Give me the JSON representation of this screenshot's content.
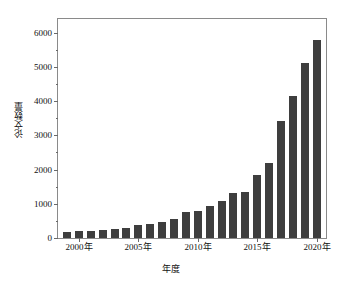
{
  "chart_data": {
    "type": "bar",
    "title": "",
    "xlabel": "年度",
    "ylabel": "论文数量",
    "categories": [
      "1999",
      "2000",
      "2001",
      "2002",
      "2003",
      "2004",
      "2005",
      "2006",
      "2007",
      "2008",
      "2009",
      "2010",
      "2011",
      "2012",
      "2013",
      "2014",
      "2015",
      "2016",
      "2017",
      "2018",
      "2019",
      "2020"
    ],
    "values": [
      180,
      200,
      200,
      240,
      270,
      300,
      370,
      400,
      480,
      560,
      760,
      780,
      950,
      1080,
      1330,
      1350,
      1850,
      2200,
      3430,
      4150,
      5100,
      5800
    ],
    "ylim": [
      0,
      6400
    ],
    "yticks": [
      0,
      1000,
      2000,
      3000,
      4000,
      5000,
      6000
    ],
    "ytick_labels": [
      "0",
      "1000",
      "2000",
      "3000",
      "4000",
      "5000",
      "6000"
    ],
    "yminor_ticks": [
      500,
      1500,
      2500,
      3500,
      4500,
      5500
    ],
    "xtick_categories": [
      "2000",
      "2005",
      "2010",
      "2015",
      "2020"
    ],
    "xtick_labels": [
      "2000年",
      "2005年",
      "2010年",
      "2015年",
      "2020年"
    ],
    "grid": false,
    "legend": null,
    "bar_color": "#3e3e3e",
    "axis_color": "#8a8a8a",
    "background_color": "#ffffff"
  }
}
